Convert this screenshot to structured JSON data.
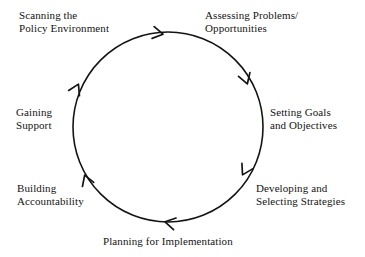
{
  "diagram": {
    "type": "cycle",
    "direction": "clockwise",
    "title": "",
    "geometry": {
      "center_x": 168,
      "center_y": 127,
      "radius": 95,
      "stroke_color": "#141414",
      "stroke_width": 1.6
    },
    "stages": [
      {
        "id": "scanning",
        "order": 1,
        "lines": [
          "Scanning the",
          "Policy Environment"
        ],
        "angle_deg": 250
      },
      {
        "id": "assessing",
        "order": 2,
        "lines": [
          "Assessing Problems/",
          "Opportunities"
        ],
        "angle_deg": 290
      },
      {
        "id": "goals",
        "order": 3,
        "lines": [
          "Setting Goals",
          "and Objectives"
        ],
        "angle_deg": 0
      },
      {
        "id": "strategies",
        "order": 4,
        "lines": [
          "Developing and",
          "Selecting Strategies"
        ],
        "angle_deg": 45
      },
      {
        "id": "planning",
        "order": 5,
        "lines": [
          "Planning for Implementation"
        ],
        "angle_deg": 90
      },
      {
        "id": "accountability",
        "order": 6,
        "lines": [
          "Building",
          "Accountability"
        ],
        "angle_deg": 135
      },
      {
        "id": "gaining",
        "order": 7,
        "lines": [
          "Gaining",
          "Support"
        ],
        "angle_deg": 180
      }
    ],
    "arrowheads": [
      {
        "id": "arrow-top",
        "x": 162,
        "y": 34,
        "rotation_deg": 10
      },
      {
        "id": "arrow-upper-right",
        "x": 247,
        "y": 83,
        "rotation_deg": 72
      },
      {
        "id": "arrow-lower-right",
        "x": 243,
        "y": 174,
        "rotation_deg": 118
      },
      {
        "id": "arrow-bottom",
        "x": 166,
        "y": 222,
        "rotation_deg": 192
      },
      {
        "id": "arrow-lower-left",
        "x": 85,
        "y": 176,
        "rotation_deg": 250
      },
      {
        "id": "arrow-upper-left",
        "x": 78,
        "y": 85,
        "rotation_deg": 296
      }
    ],
    "colors": {
      "background": "#ffffff",
      "line": "#141414",
      "text": "#141414"
    }
  }
}
